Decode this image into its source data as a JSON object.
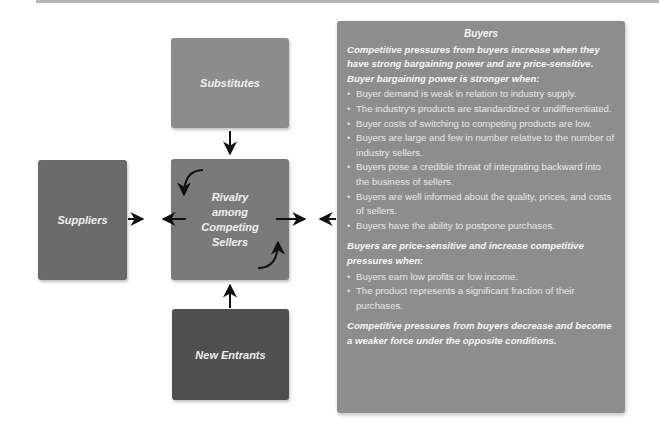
{
  "diagram": {
    "boxes": {
      "substitutes": "Substitutes",
      "rivalry": "Rivalry\namong\nCompeting\nSellers",
      "suppliers": "Suppliers",
      "new_entrants": "New Entrants"
    },
    "colors": {
      "substitutes": "#8c8c8c",
      "rivalry": "#7a7a7a",
      "suppliers": "#6a6a6a",
      "new_entrants": "#4f4f4f",
      "buyers_panel": "#8d8d8d",
      "arrow": "#111111"
    }
  },
  "buyers_panel": {
    "title": "Buyers",
    "intro": "Competitive pressures from buyers increase when they have strong bargaining power and are price-sensitive. Buyer bargaining power is stronger when:",
    "bargaining_bullets": [
      "Buyer demand is weak in relation to industry supply.",
      "The industry's products are standardized or undifferentiated.",
      "Buyer costs of switching to competing products are low.",
      "Buyers are large and few in number relative to the number of industry sellers.",
      "Buyers pose a credible threat of integrating backward into the business of sellers.",
      "Buyers are well informed about the quality, prices, and costs of sellers.",
      "Buyers have the ability to postpone purchases."
    ],
    "price_sensitive_heading": "Buyers are price-sensitive and increase competitive pressures when:",
    "price_sensitive_bullets": [
      "Buyers earn low profits or low income.",
      "The product represents a significant fraction of their purchases."
    ],
    "conclusion": "Competitive pressures from buyers decrease and become a weaker force under the opposite conditions."
  }
}
